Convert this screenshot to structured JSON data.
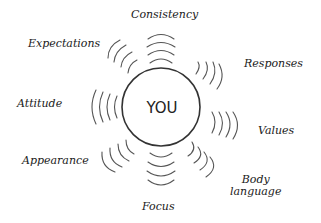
{
  "diagram": {
    "center": {
      "label": "YOU"
    },
    "labels": {
      "consistency": "Consistency",
      "expectations": "Expectations",
      "responses": "Responses",
      "attitude": "Attitude",
      "values": "Values",
      "appearance": "Appearance",
      "body_line1": "Body",
      "body_line2": "language",
      "focus": "Focus"
    },
    "colors": {
      "stroke": "#333333",
      "background": "#ffffff"
    }
  }
}
